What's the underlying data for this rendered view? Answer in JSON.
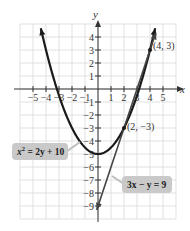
{
  "chart_data": {
    "type": "line",
    "title": "",
    "xlabel": "x",
    "ylabel": "y",
    "xlim": [
      -6,
      6
    ],
    "ylim": [
      -10,
      5
    ],
    "grid": true,
    "x_ticks": [
      -5,
      -4,
      -3,
      -2,
      -1,
      1,
      2,
      3,
      4,
      5
    ],
    "y_ticks": [
      4,
      3,
      2,
      1,
      -1,
      -2,
      -3,
      -4,
      -5,
      -6,
      -7,
      -8,
      -9
    ],
    "x_tick_labels": [
      "−5",
      "−4",
      "−3",
      "−2",
      "−1",
      "1",
      "2",
      "3",
      "4",
      "5"
    ],
    "y_tick_labels": [
      "4",
      "3",
      "2",
      "1",
      "−1",
      "−2",
      "−3",
      "−4",
      "−5",
      "−6",
      "−7",
      "−8",
      "−9"
    ],
    "series": [
      {
        "name": "x² = 2y + 10",
        "kind": "parabola",
        "equation": "y = (x^2 - 10) / 2",
        "vertex": [
          0,
          -5
        ],
        "x_range": [
          -4.4,
          4.4
        ],
        "color": "#1a1a1a"
      },
      {
        "name": "3x − y = 9",
        "kind": "line",
        "equation": "y = 3x - 9",
        "x_range": [
          -0.1,
          4.45
        ],
        "color": "#444444"
      }
    ],
    "points": [
      {
        "x": 4,
        "y": 3,
        "label": "(4, 3)"
      },
      {
        "x": 2,
        "y": -3,
        "label": "(2, −3)"
      }
    ],
    "annotations": [
      {
        "text": "x² = 2y + 10",
        "target": "parabola"
      },
      {
        "text": "3x − y = 9",
        "target": "line"
      }
    ]
  },
  "labels": {
    "x_axis": "x",
    "y_axis": "y",
    "point_a": "(4, 3)",
    "point_b": "(2, −3)",
    "eq_parabola_base": "x",
    "eq_parabola_sup": "2",
    "eq_parabola_rest": " = 2y + 10",
    "eq_line": "3x − y = 9"
  }
}
